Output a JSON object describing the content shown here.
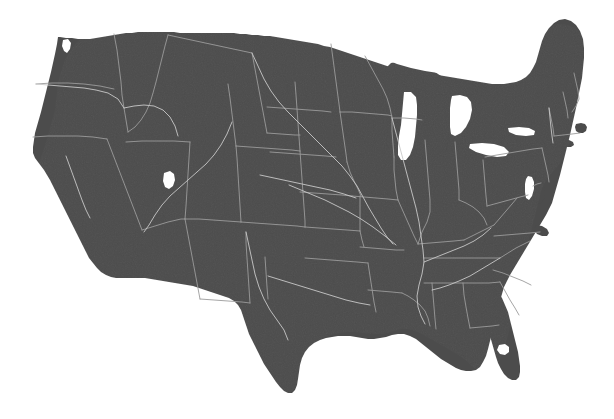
{
  "figure": {
    "kind": "choropleth-silhouette-map",
    "projection": "Albers conic",
    "title": "",
    "caption": "",
    "width": 614,
    "height": 419
  },
  "colors": {
    "background": "#ffffff",
    "land_fill": "#4c4c4c",
    "state_border": "#9b9b9b",
    "water_fill": "#ffffff",
    "river_stroke": "#c8c8c8"
  },
  "legend": {
    "present": false,
    "entries": []
  },
  "labels": {
    "present": false,
    "items": []
  },
  "water_bodies": [
    "Lake Superior",
    "Lake Michigan",
    "Lake Huron",
    "Lake Erie",
    "Lake Ontario",
    "Great Salt Lake",
    "Lake Okeechobee",
    "Chesapeake Bay",
    "Puget Sound",
    "Gulf of Mexico",
    "Atlantic Ocean",
    "Pacific Ocean"
  ],
  "regions": [
    "Pacific Northwest",
    "California",
    "Great Basin",
    "Southwest",
    "Rocky Mountains",
    "Great Plains",
    "Midwest",
    "Great Lakes",
    "Northeast",
    "Mid-Atlantic",
    "Southeast",
    "Gulf Coast",
    "Florida Peninsula"
  ],
  "states": [
    "Washington",
    "Oregon",
    "California",
    "Idaho",
    "Nevada",
    "Utah",
    "Arizona",
    "Montana",
    "Wyoming",
    "Colorado",
    "New Mexico",
    "North Dakota",
    "South Dakota",
    "Nebraska",
    "Kansas",
    "Oklahoma",
    "Texas",
    "Minnesota",
    "Iowa",
    "Missouri",
    "Arkansas",
    "Louisiana",
    "Wisconsin",
    "Illinois",
    "Michigan",
    "Indiana",
    "Ohio",
    "Kentucky",
    "Tennessee",
    "Mississippi",
    "Alabama",
    "Georgia",
    "Florida",
    "South Carolina",
    "North Carolina",
    "Virginia",
    "West Virginia",
    "Maryland",
    "Delaware",
    "Pennsylvania",
    "New Jersey",
    "New York",
    "Connecticut",
    "Rhode Island",
    "Massachusetts",
    "Vermont",
    "New Hampshire",
    "Maine"
  ]
}
